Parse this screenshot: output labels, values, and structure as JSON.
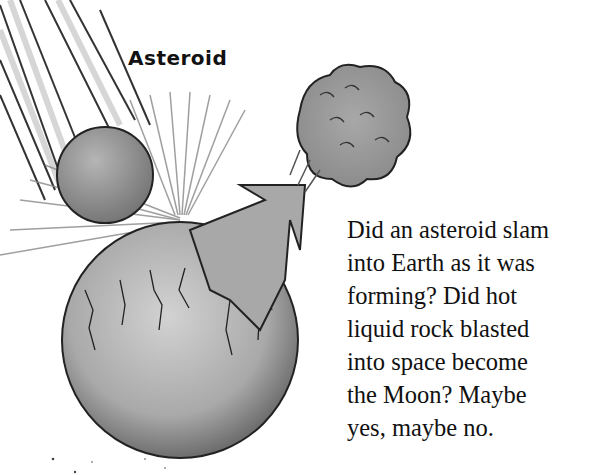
{
  "illustration": {
    "label": "Asteroid",
    "elements": [
      "asteroid",
      "impact-streaks",
      "earth",
      "arrow",
      "moon-debris-cloud"
    ]
  },
  "caption": {
    "lines": [
      "Did an asteroid slam",
      "into Earth as it was",
      "forming? Did hot",
      "liquid rock blasted",
      "into space become",
      "the Moon? Maybe",
      "yes, maybe no."
    ]
  }
}
